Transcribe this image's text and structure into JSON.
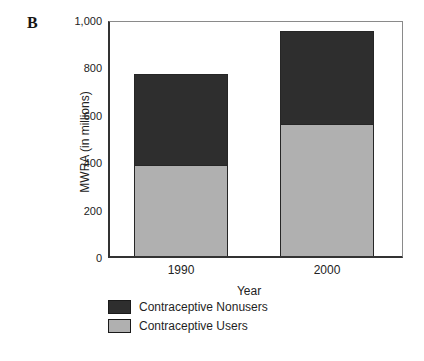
{
  "panel_label": "B",
  "chart_data": {
    "type": "bar",
    "stacked": true,
    "title": "",
    "xlabel": "Year",
    "ylabel": "MWRA (in millions)",
    "categories": [
      "1990",
      "2000"
    ],
    "series": [
      {
        "name": "Contraceptive Users",
        "values": [
          390,
          560
        ],
        "color": "#b0b0b0"
      },
      {
        "name": "Contraceptive Nonusers",
        "values": [
          380,
          390
        ],
        "color": "#2e2e2e"
      }
    ],
    "totals": [
      770,
      950
    ],
    "ylim": [
      0,
      1000
    ],
    "yticks": [
      {
        "value": 0,
        "label": "0"
      },
      {
        "value": 200,
        "label": "200"
      },
      {
        "value": 400,
        "label": "400"
      },
      {
        "value": 600,
        "label": "600"
      },
      {
        "value": 800,
        "label": "800"
      },
      {
        "value": 1000,
        "label": "1,000"
      }
    ],
    "grid": false,
    "legend_position": "bottom-left",
    "legend": [
      {
        "label": "Contraceptive Nonusers",
        "color": "#2e2e2e"
      },
      {
        "label": "Contraceptive Users",
        "color": "#b0b0b0"
      }
    ]
  }
}
